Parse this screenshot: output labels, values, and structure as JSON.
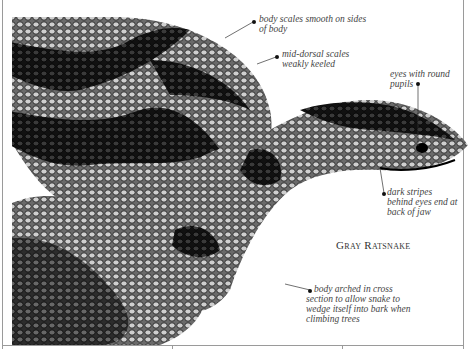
{
  "title": "Gray Ratsnake",
  "annotations": [
    {
      "id": "body-scales",
      "text": "body scales smooth on sides of body"
    },
    {
      "id": "mid-dorsal",
      "text": "mid-dorsal scales weakly keeled"
    },
    {
      "id": "eyes",
      "text": "eyes with round pupils"
    },
    {
      "id": "stripes",
      "text": "dark stripes behind eyes end at back of jaw"
    },
    {
      "id": "body-arched",
      "text": "body arched in cross section to allow snake to wedge itself into bark when climbing trees"
    }
  ],
  "colors": {
    "ink": "#111111",
    "frame": "#9a9a9a",
    "note": "#444444"
  }
}
